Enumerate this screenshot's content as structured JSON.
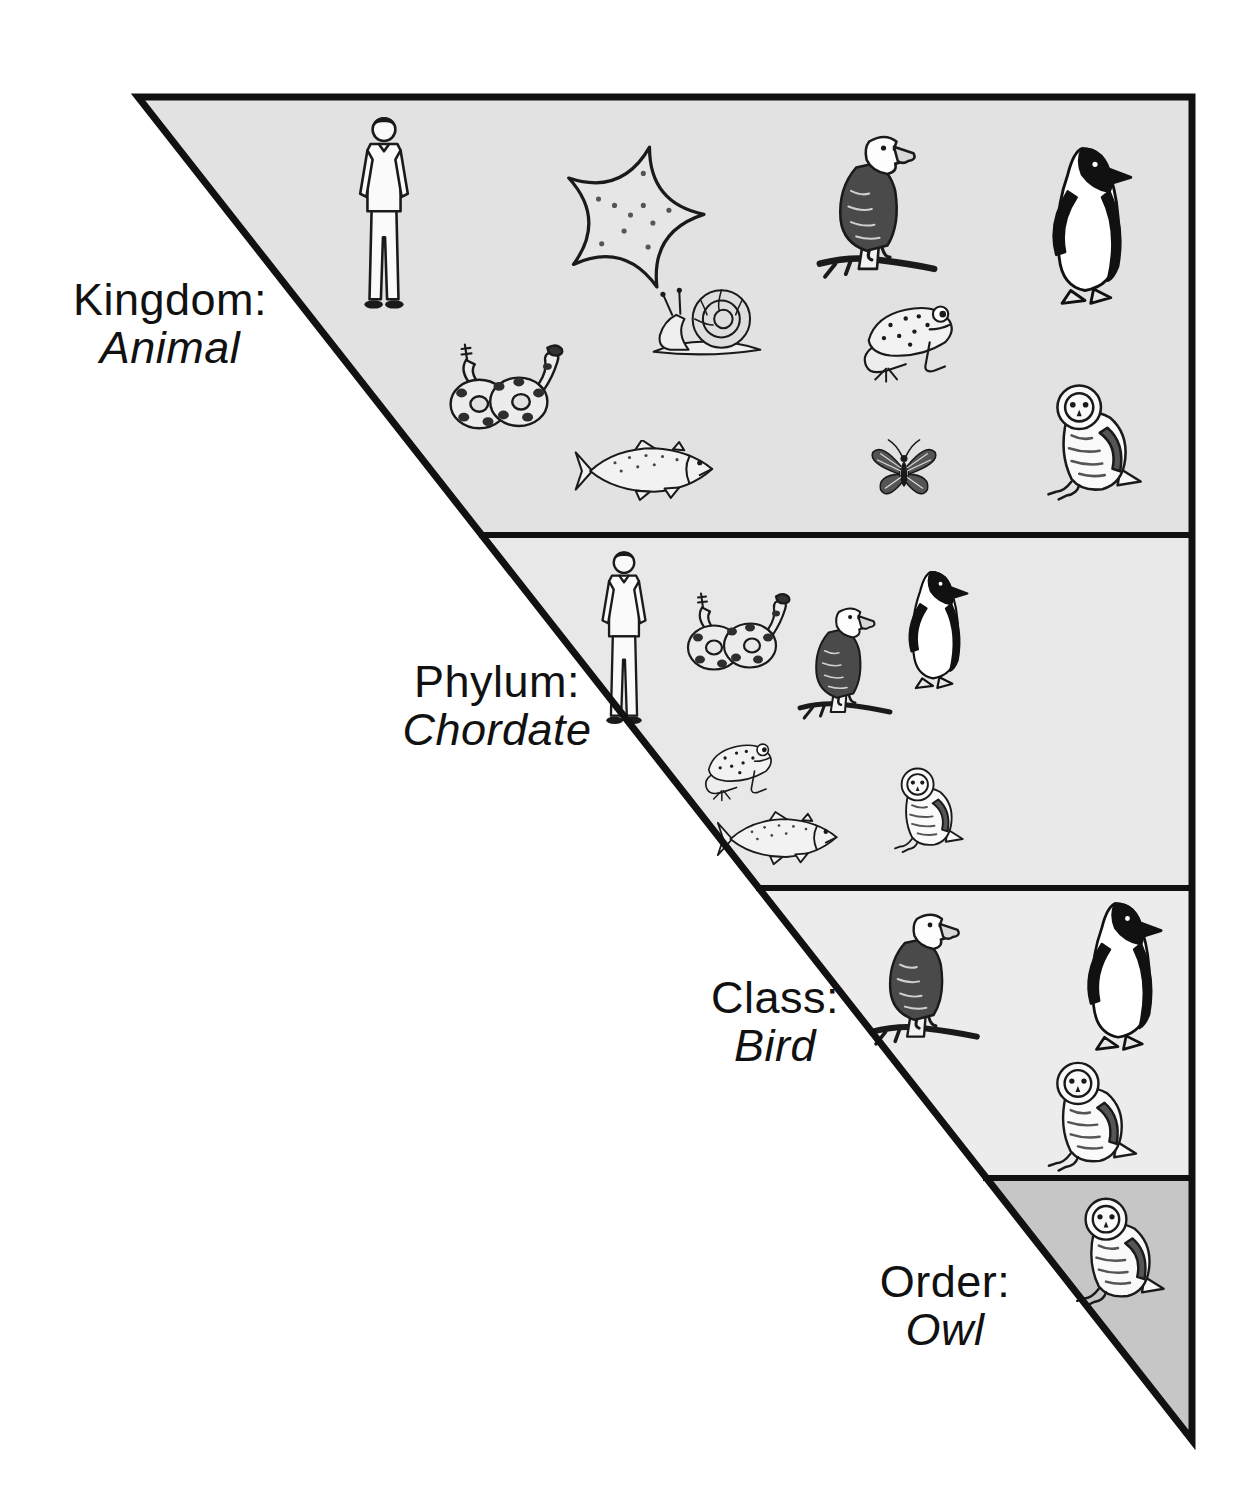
{
  "diagram": {
    "type": "taxonomic-classification-funnel",
    "levels": [
      {
        "rank": "Kingdom:",
        "taxon": "Animal",
        "band_color": "#e2e2e2",
        "animals": [
          {
            "icon": "human",
            "x": 352,
            "y": 113,
            "w": 64,
            "h": 207
          },
          {
            "icon": "starfish",
            "x": 538,
            "y": 135,
            "w": 185,
            "h": 160
          },
          {
            "icon": "eagle",
            "x": 812,
            "y": 113,
            "w": 130,
            "h": 187
          },
          {
            "icon": "penguin",
            "x": 1026,
            "y": 140,
            "w": 118,
            "h": 172
          },
          {
            "icon": "snail",
            "x": 612,
            "y": 280,
            "w": 190,
            "h": 82
          },
          {
            "icon": "frog",
            "x": 848,
            "y": 288,
            "w": 122,
            "h": 98
          },
          {
            "icon": "snake",
            "x": 430,
            "y": 338,
            "w": 138,
            "h": 110
          },
          {
            "icon": "owl",
            "x": 1028,
            "y": 372,
            "w": 128,
            "h": 132
          },
          {
            "icon": "fish",
            "x": 550,
            "y": 440,
            "w": 192,
            "h": 62
          },
          {
            "icon": "butterfly",
            "x": 852,
            "y": 432,
            "w": 104,
            "h": 78
          }
        ]
      },
      {
        "rank": "Phylum:",
        "taxon": "Chordate",
        "band_color": "#e8e8e8",
        "animals": [
          {
            "icon": "human",
            "x": 596,
            "y": 540,
            "w": 56,
            "h": 202
          },
          {
            "icon": "snake",
            "x": 672,
            "y": 580,
            "w": 120,
            "h": 115
          },
          {
            "icon": "eagle",
            "x": 794,
            "y": 583,
            "w": 102,
            "h": 160
          },
          {
            "icon": "penguin",
            "x": 890,
            "y": 545,
            "w": 86,
            "h": 170
          },
          {
            "icon": "frog",
            "x": 694,
            "y": 716,
            "w": 90,
            "h": 102
          },
          {
            "icon": "fish",
            "x": 716,
            "y": 806,
            "w": 126,
            "h": 66
          },
          {
            "icon": "owl",
            "x": 880,
            "y": 740,
            "w": 94,
            "h": 134
          }
        ]
      },
      {
        "rank": "Class:",
        "taxon": "Bird",
        "band_color": "#ececec",
        "animals": [
          {
            "icon": "eagle",
            "x": 864,
            "y": 894,
            "w": 120,
            "h": 170
          },
          {
            "icon": "penguin",
            "x": 1064,
            "y": 893,
            "w": 108,
            "h": 167
          },
          {
            "icon": "owl",
            "x": 1028,
            "y": 1052,
            "w": 124,
            "h": 121
          }
        ]
      },
      {
        "rank": "Order:",
        "taxon": "Owl",
        "band_color": "#c6c6c6",
        "animals": [
          {
            "icon": "owl",
            "x": 1054,
            "y": 1188,
            "w": 128,
            "h": 120
          }
        ]
      }
    ],
    "colors": {
      "outline": "#111111",
      "background": "#ffffff",
      "text": "#111111"
    }
  }
}
